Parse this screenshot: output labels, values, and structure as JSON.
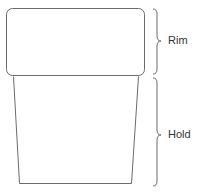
{
  "diagram": {
    "parts": [
      {
        "id": "rim",
        "label": "Rim"
      },
      {
        "id": "hold",
        "label": "Hold"
      }
    ],
    "colors": {
      "stroke": "#6b6b6b",
      "text": "#333333",
      "background": "#ffffff"
    }
  }
}
